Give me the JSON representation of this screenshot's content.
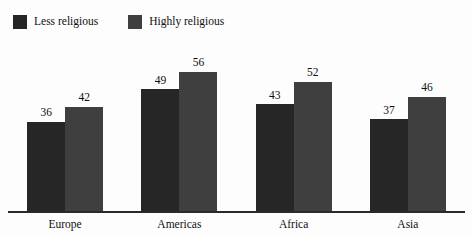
{
  "chart_data": {
    "type": "bar",
    "title": "",
    "subtitle": "",
    "xlabel": "",
    "ylabel": "",
    "ylim": [
      0,
      60
    ],
    "grid": false,
    "legend_position": "top-left",
    "categories": [
      "Europe",
      "Americas",
      "Africa",
      "Asia"
    ],
    "series": [
      {
        "name": "Less religious",
        "color": "#262626",
        "values": [
          36,
          49,
          43,
          37
        ]
      },
      {
        "name": "Highly religious",
        "color": "#3f3f3f",
        "values": [
          42,
          56,
          52,
          46
        ]
      }
    ]
  },
  "legend": {
    "items": [
      {
        "label": "Less religious",
        "swatch_color": "#262626",
        "swatch_name": "legend-swatch-less-religious"
      },
      {
        "label": "Highly religious",
        "swatch_color": "#3f3f3f",
        "swatch_name": "legend-swatch-highly-religious"
      }
    ]
  },
  "axis": {
    "baseline_color": "#2a2a2a"
  }
}
